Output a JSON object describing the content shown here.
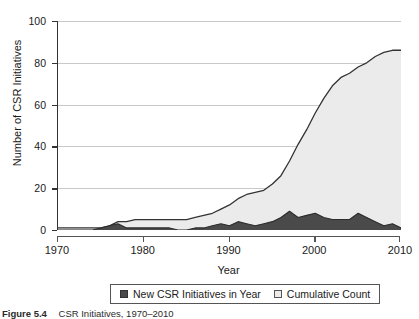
{
  "chart_data": {
    "type": "area",
    "title": "",
    "xlabel": "Year",
    "ylabel": "Number of CSR Initiatives",
    "xlim": [
      1970,
      2010
    ],
    "ylim": [
      0,
      100
    ],
    "grid": true,
    "legend_position": "bottom",
    "xticks": [
      "1970",
      "1980",
      "1990",
      "2000",
      "2010"
    ],
    "yticks": [
      "0",
      "20",
      "40",
      "60",
      "80",
      "100"
    ],
    "x": [
      1970,
      1971,
      1972,
      1973,
      1974,
      1975,
      1976,
      1977,
      1978,
      1979,
      1980,
      1981,
      1982,
      1983,
      1984,
      1985,
      1986,
      1987,
      1988,
      1989,
      1990,
      1991,
      1992,
      1993,
      1994,
      1995,
      1996,
      1997,
      1998,
      1999,
      2000,
      2001,
      2002,
      2003,
      2004,
      2005,
      2006,
      2007,
      2008,
      2009,
      2010
    ],
    "series": [
      {
        "name": "New CSR Initiatives in Year",
        "color": "#4a4a4a",
        "values": [
          0,
          0,
          0,
          0,
          0,
          1,
          2,
          3,
          1,
          1,
          1,
          1,
          1,
          1,
          0,
          0,
          1,
          1,
          2,
          3,
          2,
          4,
          3,
          2,
          3,
          4,
          6,
          9,
          6,
          7,
          8,
          6,
          5,
          5,
          5,
          8,
          6,
          4,
          2,
          3,
          1
        ]
      },
      {
        "name": "Cumulative Count",
        "color": "#ebebeb",
        "values": [
          1,
          1,
          1,
          1,
          1,
          1,
          2,
          4,
          4,
          5,
          5,
          5,
          5,
          5,
          5,
          5,
          6,
          7,
          8,
          10,
          12,
          15,
          17,
          18,
          19,
          22,
          26,
          33,
          41,
          48,
          56,
          63,
          69,
          73,
          75,
          78,
          80,
          83,
          85,
          86,
          86
        ]
      }
    ]
  },
  "legend": {
    "items": [
      {
        "label": "New CSR Initiatives in Year",
        "swatch": "dark-square-icon"
      },
      {
        "label": "Cumulative Count",
        "swatch": "light-square-icon"
      }
    ]
  },
  "caption": {
    "number": "Figure 5.4",
    "text": "CSR Initiatives, 1970–2010"
  }
}
